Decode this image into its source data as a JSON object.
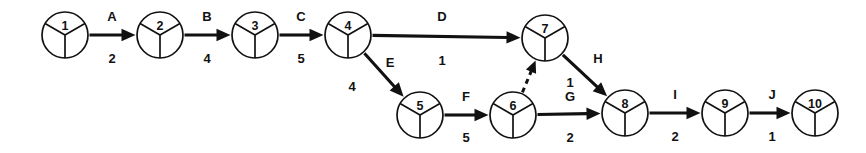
{
  "diagram": {
    "type": "activity-on-arrow-network",
    "title": "",
    "canvas": {
      "width": 866,
      "height": 153,
      "background": "#ffffff"
    },
    "style": {
      "line_color": "#111111",
      "node_fill": "#ffffff",
      "node_radius": 23
    },
    "nodes": [
      {
        "id": "n1",
        "label": "1",
        "cx": 65,
        "cy": 35
      },
      {
        "id": "n2",
        "label": "2",
        "cx": 160,
        "cy": 35
      },
      {
        "id": "n3",
        "label": "3",
        "cx": 255,
        "cy": 35
      },
      {
        "id": "n4",
        "label": "4",
        "cx": 348,
        "cy": 35
      },
      {
        "id": "n5",
        "label": "5",
        "cx": 420,
        "cy": 115
      },
      {
        "id": "n6",
        "label": "6",
        "cx": 513,
        "cy": 115
      },
      {
        "id": "n7",
        "label": "7",
        "cx": 545,
        "cy": 38
      },
      {
        "id": "n8",
        "label": "8",
        "cx": 625,
        "cy": 113
      },
      {
        "id": "n9",
        "label": "9",
        "cx": 725,
        "cy": 113
      },
      {
        "id": "n10",
        "label": "10",
        "cx": 815,
        "cy": 113
      }
    ],
    "edges": [
      {
        "id": "eA",
        "activity": "A",
        "duration": "2",
        "from": "n1",
        "to": "n2",
        "dummy": false,
        "name_pos": {
          "x": 112,
          "y": 16
        },
        "duration_pos": {
          "x": 112,
          "y": 58
        }
      },
      {
        "id": "eB",
        "activity": "B",
        "duration": "4",
        "from": "n2",
        "to": "n3",
        "dummy": false,
        "name_pos": {
          "x": 207,
          "y": 16
        },
        "duration_pos": {
          "x": 207,
          "y": 58
        }
      },
      {
        "id": "eC",
        "activity": "C",
        "duration": "5",
        "from": "n3",
        "to": "n4",
        "dummy": false,
        "name_pos": {
          "x": 301,
          "y": 16
        },
        "duration_pos": {
          "x": 301,
          "y": 58
        }
      },
      {
        "id": "eD",
        "activity": "D",
        "duration": "1",
        "from": "n4",
        "to": "n7",
        "dummy": false,
        "name_pos": {
          "x": 442,
          "y": 16
        },
        "duration_pos": {
          "x": 442,
          "y": 60
        }
      },
      {
        "id": "eE",
        "activity": "E",
        "duration": "4",
        "from": "n4",
        "to": "n5",
        "dummy": false,
        "name_pos": {
          "x": 390,
          "y": 62
        },
        "duration_pos": {
          "x": 352,
          "y": 86
        }
      },
      {
        "id": "eF",
        "activity": "F",
        "duration": "5",
        "from": "n5",
        "to": "n6",
        "dummy": false,
        "name_pos": {
          "x": 466,
          "y": 96
        },
        "duration_pos": {
          "x": 466,
          "y": 137
        }
      },
      {
        "id": "eG",
        "activity": "G",
        "duration": "2",
        "from": "n6",
        "to": "n8",
        "dummy": false,
        "name_pos": {
          "x": 570,
          "y": 96
        },
        "duration_pos": {
          "x": 570,
          "y": 137
        }
      },
      {
        "id": "eH",
        "activity": "H",
        "duration": "1",
        "from": "n7",
        "to": "n8",
        "dummy": false,
        "name_pos": {
          "x": 598,
          "y": 58
        },
        "duration_pos": {
          "x": 570,
          "y": 82
        }
      },
      {
        "id": "eI",
        "activity": "I",
        "duration": "2",
        "from": "n8",
        "to": "n9",
        "dummy": false,
        "name_pos": {
          "x": 675,
          "y": 94
        },
        "duration_pos": {
          "x": 675,
          "y": 136
        }
      },
      {
        "id": "eJ",
        "activity": "J",
        "duration": "1",
        "from": "n9",
        "to": "n10",
        "dummy": false,
        "name_pos": {
          "x": 772,
          "y": 94
        },
        "duration_pos": {
          "x": 772,
          "y": 136
        }
      },
      {
        "id": "eDummy",
        "activity": "",
        "duration": "",
        "from": "n6",
        "to": "n7",
        "dummy": true,
        "name_pos": null,
        "duration_pos": null
      }
    ]
  }
}
